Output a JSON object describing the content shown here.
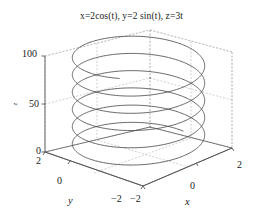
{
  "figure": {
    "title": "x=2cos(t), y=2 sin(t), z=3t",
    "background_color": "#ffffff",
    "curve_color": "#4a4a4a",
    "axis_color": "#555555",
    "grid_color": "#aaaaaa"
  },
  "axes": {
    "z": {
      "label": "z",
      "ticks": [
        "0",
        "50",
        "100"
      ],
      "tick_100": "100",
      "tick_50": "50",
      "tick_0": "0"
    },
    "y": {
      "label": "y",
      "ticks": [
        "2",
        "0",
        "-2"
      ],
      "tick_2": "2",
      "tick_0": "0",
      "tick_m2": "−2"
    },
    "x": {
      "label": "x",
      "ticks": [
        "-2",
        "0",
        "2"
      ],
      "tick_m2": "−2",
      "tick_0": "0",
      "tick_2": "2"
    }
  },
  "chart_data": {
    "type": "line",
    "title": "x=2cos(t), y=2 sin(t), z=3t",
    "xlabel": "x",
    "ylabel": "y",
    "zlabel": "z",
    "xlim": [
      -2,
      2
    ],
    "ylim": [
      -2,
      2
    ],
    "zlim": [
      0,
      105
    ],
    "xticks": [
      -2,
      0,
      2
    ],
    "yticks": [
      -2,
      0,
      2
    ],
    "zticks": [
      0,
      50,
      100
    ],
    "grid": true,
    "legend": null,
    "parametric": {
      "x": "2*cos(t)",
      "y": "2*sin(t)",
      "z": "3*t",
      "t_start": 0,
      "t_end": 35,
      "turns": 5.57,
      "radius": 2,
      "pitch_per_turn": 18.85
    }
  }
}
